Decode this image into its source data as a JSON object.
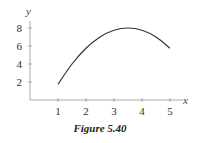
{
  "chart_data": {
    "type": "line",
    "title": "",
    "caption": "Figure 5.40",
    "xlabel": "x",
    "ylabel": "y",
    "xlim": [
      0,
      5.4
    ],
    "ylim": [
      0,
      8.8
    ],
    "xticks": [
      1,
      2,
      3,
      4,
      5
    ],
    "yticks": [
      2,
      4,
      6,
      8
    ],
    "grid": false,
    "legend": "none",
    "series": [
      {
        "name": "curve",
        "description": "concave-down curve from x=1 to x=5, peak near (3.5, 8)",
        "x": [
          1,
          1.5,
          2,
          2.5,
          3,
          3.5,
          4,
          4.5,
          5
        ],
        "y": [
          1.75,
          4.0,
          5.75,
          7.0,
          7.75,
          8.0,
          7.75,
          7.0,
          5.75
        ]
      }
    ]
  }
}
